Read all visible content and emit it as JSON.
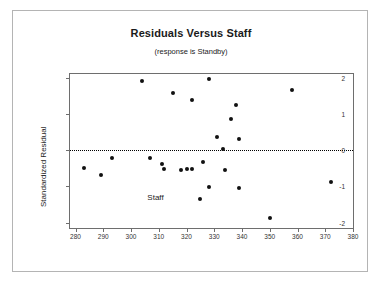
{
  "figure": {
    "title": "Residuals Versus Staff",
    "subtitle": "(response is Standby)"
  },
  "chart_data": {
    "type": "scatter",
    "title": "Residuals Versus Staff",
    "subtitle": "(response is Standby)",
    "xlabel": "Staff",
    "ylabel": "Standardized Residual",
    "xlim": [
      278,
      380
    ],
    "ylim": [
      -2.15,
      2.1
    ],
    "xticks": [
      280,
      290,
      300,
      310,
      320,
      330,
      340,
      350,
      360,
      370,
      380
    ],
    "yticks": [
      2,
      1,
      0,
      -1,
      -2
    ],
    "grid": false,
    "legend": null,
    "reference_line": {
      "type": "horizontal",
      "y": 0,
      "style": "dotted",
      "color": "#000000"
    },
    "marker": {
      "shape": "circle",
      "color": "#111111",
      "size": 4
    },
    "points": [
      {
        "x": 283,
        "y": -0.5
      },
      {
        "x": 289,
        "y": -0.69
      },
      {
        "x": 293,
        "y": -0.22
      },
      {
        "x": 304,
        "y": 1.92
      },
      {
        "x": 307,
        "y": -0.22
      },
      {
        "x": 311,
        "y": -0.37
      },
      {
        "x": 312,
        "y": -0.53
      },
      {
        "x": 315,
        "y": 1.57
      },
      {
        "x": 318,
        "y": -0.55
      },
      {
        "x": 320,
        "y": -0.51
      },
      {
        "x": 322,
        "y": 1.38
      },
      {
        "x": 322,
        "y": -0.51
      },
      {
        "x": 325,
        "y": -1.35
      },
      {
        "x": 326,
        "y": -0.33
      },
      {
        "x": 328,
        "y": 1.95
      },
      {
        "x": 328,
        "y": -1.02
      },
      {
        "x": 331,
        "y": 0.36
      },
      {
        "x": 333,
        "y": 0.02
      },
      {
        "x": 334,
        "y": -0.56
      },
      {
        "x": 336,
        "y": 0.87
      },
      {
        "x": 338,
        "y": 1.24
      },
      {
        "x": 339,
        "y": 0.3
      },
      {
        "x": 339,
        "y": -1.05
      },
      {
        "x": 350,
        "y": -1.88
      },
      {
        "x": 358,
        "y": 1.67
      },
      {
        "x": 372,
        "y": -0.88
      }
    ]
  }
}
